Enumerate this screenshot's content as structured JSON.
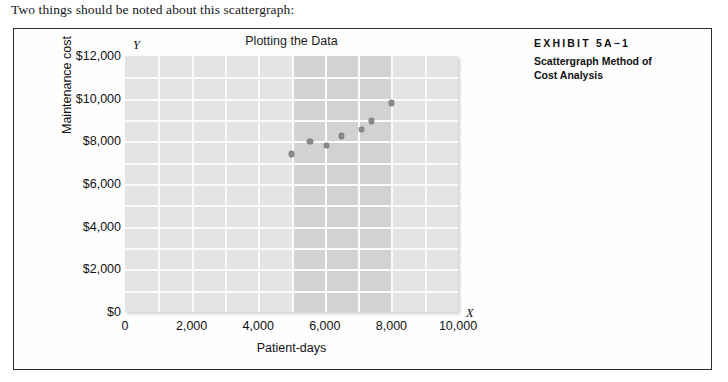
{
  "intro": {
    "text": "Two things should be noted about this scattergraph:"
  },
  "exhibit": {
    "kicker": "EXHIBIT 5A−1",
    "subtitle": "Scattergraph Method of Cost Analysis"
  },
  "chart_data": {
    "type": "scatter",
    "title": "Plotting the Data",
    "xlabel": "Patient-days",
    "ylabel": "Maintenance cost",
    "x_axis_letter": "X",
    "y_axis_letter": "Y",
    "xlim": [
      0,
      10000
    ],
    "ylim": [
      0,
      12000
    ],
    "xticks": [
      0,
      2000,
      4000,
      6000,
      8000,
      10000
    ],
    "xticklabels": [
      "0",
      "2,000",
      "4,000",
      "6,000",
      "8,000",
      "10,000"
    ],
    "yticks": [
      0,
      2000,
      4000,
      6000,
      8000,
      10000,
      12000
    ],
    "yticklabels": [
      "$0",
      "$2,000",
      "$4,000",
      "$6,000",
      "$8,000",
      "$10,000",
      "$12,000"
    ],
    "grid": true,
    "grid_columns": 10,
    "grid_rows": 12,
    "legend": null,
    "points": [
      {
        "x": 5000,
        "y": 7400
      },
      {
        "x": 5550,
        "y": 8000
      },
      {
        "x": 6050,
        "y": 7800
      },
      {
        "x": 6500,
        "y": 8250
      },
      {
        "x": 7100,
        "y": 8550
      },
      {
        "x": 7400,
        "y": 8950
      },
      {
        "x": 8000,
        "y": 9800
      }
    ],
    "shaded_bands": [
      {
        "x_start": 5000,
        "x_end": 6000
      },
      {
        "x_start": 6000,
        "x_end": 7000
      },
      {
        "x_start": 7000,
        "x_end": 8000
      }
    ],
    "colors": {
      "plot_background": "#e4e4e4",
      "band_background": "#d2d2d2",
      "gridline": "#fbfbfb",
      "point": "#8a8a8a",
      "text": "#111111",
      "frame_border": "#2b2b2b"
    }
  }
}
